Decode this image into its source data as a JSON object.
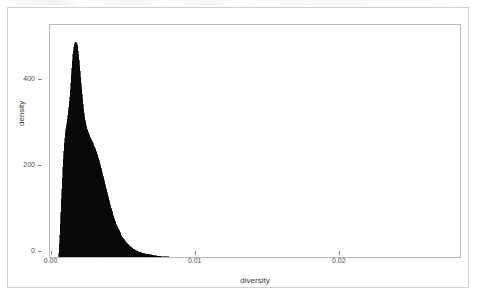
{
  "figure": {
    "background_color": "#ffffff",
    "panel_border_color": "#b9b9b9",
    "outer_frame_color": "#cfcfcf",
    "fill_color": "#000000"
  },
  "axes": {
    "y_title": "density",
    "x_title": "diversity",
    "y_ticks": [
      "0",
      "200",
      "400"
    ],
    "x_ticks": [
      "0.00",
      "0.01",
      "0.02"
    ]
  },
  "chart_data": {
    "type": "area",
    "title": "",
    "subtitle": "",
    "xlabel": "diversity",
    "ylabel": "density",
    "xlim": [
      -0.0006,
      0.028
    ],
    "ylim": [
      0,
      545
    ],
    "xticks": [
      0.0,
      0.01,
      0.02
    ],
    "xticklabels": [
      "0.00",
      "0.01",
      "0.02"
    ],
    "yticks": [
      0,
      200,
      400
    ],
    "yticklabels": [
      "0",
      "200",
      "400"
    ],
    "grid": false,
    "legend": false,
    "legend_position": "none",
    "fill": "#000000",
    "peak_x": 0.0016,
    "peak_y": 506,
    "data_x_min": 0.0001,
    "data_x_max": 0.0265,
    "annotations": [],
    "series": [
      {
        "name": "diversity",
        "x": [
          0.0,
          0.0001,
          0.0002,
          0.0003,
          0.0004,
          0.0005,
          0.0006,
          0.0007,
          0.0008,
          0.0009,
          0.001,
          0.0011,
          0.0012,
          0.0013,
          0.0014,
          0.0015,
          0.0016,
          0.0017,
          0.0018,
          0.0019,
          0.002,
          0.0022,
          0.0024,
          0.0026,
          0.0028,
          0.003,
          0.0032,
          0.0034,
          0.0036,
          0.0038,
          0.004,
          0.0044,
          0.0048,
          0.0052,
          0.0056,
          0.006,
          0.007,
          0.008,
          0.009,
          0.01,
          0.012,
          0.014,
          0.016,
          0.018,
          0.02,
          0.022,
          0.024,
          0.0265
        ],
        "values": [
          0,
          58,
          140,
          212,
          268,
          300,
          322,
          348,
          382,
          432,
          478,
          500,
          506,
          498,
          470,
          430,
          392,
          358,
          330,
          312,
          300,
          282,
          268,
          252,
          230,
          205,
          178,
          150,
          124,
          100,
          80,
          52,
          34,
          23,
          16,
          12,
          6,
          4,
          3,
          2.4,
          1.8,
          1.4,
          1.1,
          0.9,
          0.7,
          0.5,
          0.35,
          0.2
        ]
      }
    ]
  }
}
